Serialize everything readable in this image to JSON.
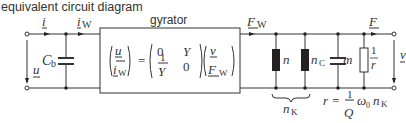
{
  "title": "equivalent circuit diagram",
  "gyrator": {
    "label": "gyrator",
    "lhs": [
      "u",
      "i",
      "W"
    ],
    "matrix": {
      "a11": "0",
      "a12": "Y",
      "a21_num": "1",
      "a21_den": "Y",
      "a22": "0"
    },
    "rhs": [
      "v",
      "F",
      "W"
    ]
  },
  "left": {
    "current_in": "i",
    "current_w": "i",
    "current_w_sub": "W",
    "voltage": "u",
    "capacitor": "C",
    "capacitor_sub": "b"
  },
  "right": {
    "force_w": "F",
    "force_w_sub": "W",
    "force_out": "F",
    "velocity": "v",
    "spring1": "n",
    "spring2": "n",
    "spring2_sub": "C",
    "mass": "m",
    "resistor_num": "1",
    "resistor_den": "r",
    "brace_label": "n",
    "brace_sub": "K",
    "formula": {
      "lhs": "r =",
      "num": "1",
      "den": "Q",
      "omega": "ω",
      "omega_sub": "0",
      "n": "n",
      "n_sub": "K"
    }
  },
  "colors": {
    "line": "#333333",
    "bg": "#ffffff"
  }
}
